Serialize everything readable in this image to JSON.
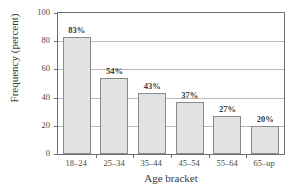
{
  "chart_data": {
    "type": "bar",
    "title": "",
    "xlabel": "Age bracket",
    "ylabel": "Frequency (percent)",
    "categories": [
      "18–24",
      "25–34",
      "35–44",
      "45–54",
      "55–64",
      "65–up"
    ],
    "values": [
      83,
      54,
      43,
      37,
      27,
      20
    ],
    "data_labels": [
      "83%",
      "54%",
      "43%",
      "37%",
      "27%",
      "20%"
    ],
    "ylim": [
      0,
      100
    ],
    "yticks": [
      100,
      80,
      60,
      40,
      20,
      0
    ],
    "ytick_labels": [
      "100",
      "80",
      "60",
      "40",
      "20",
      "0"
    ],
    "grid": true,
    "legend": false,
    "bar_fill_color": "#e2e2e2",
    "bar_border_color": "#8a8a8a",
    "gridline_color": "#b9b9b9",
    "axis_color": "#6e6e6e"
  }
}
